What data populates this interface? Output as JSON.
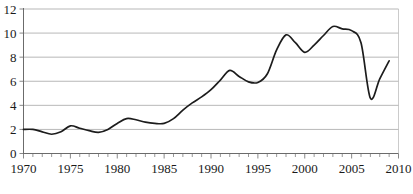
{
  "chart_data": {
    "type": "line",
    "title": "",
    "subtitle": "",
    "xlabel": "",
    "ylabel": "",
    "xlim": [
      1970,
      2010
    ],
    "ylim": [
      0,
      12
    ],
    "grid": true,
    "grid_axis": "y",
    "legend": false,
    "legend_position": "none",
    "smoothing": "spline",
    "line_color": "#1c1c1c",
    "grid_color": "#9a9a9a",
    "axis_color": "#6b6b6b",
    "x_tick_labels": [
      "1970",
      "1975",
      "1980",
      "1985",
      "1990",
      "1995",
      "2000",
      "2005",
      "2010"
    ],
    "x_tick_values": [
      1970,
      1975,
      1980,
      1985,
      1990,
      1995,
      2000,
      2005,
      2010
    ],
    "x_minor_tick_interval": 1,
    "y_tick_labels": [
      "0",
      "2",
      "4",
      "6",
      "8",
      "10",
      "12"
    ],
    "y_tick_values": [
      0,
      2,
      4,
      6,
      8,
      10,
      12
    ],
    "x": [
      1970,
      1971,
      1972,
      1973,
      1974,
      1975,
      1976,
      1977,
      1978,
      1979,
      1980,
      1981,
      1982,
      1983,
      1984,
      1985,
      1986,
      1987,
      1988,
      1989,
      1990,
      1991,
      1992,
      1993,
      1994,
      1995,
      1996,
      1997,
      1998,
      1999,
      2000,
      2001,
      2002,
      2003,
      2004,
      2005,
      2006,
      2007,
      2008,
      2009
    ],
    "values": [
      2.0,
      2.0,
      1.8,
      1.6,
      1.8,
      2.3,
      2.1,
      1.9,
      1.75,
      2.0,
      2.5,
      2.9,
      2.8,
      2.6,
      2.5,
      2.5,
      2.9,
      3.6,
      4.2,
      4.7,
      5.3,
      6.1,
      6.9,
      6.4,
      5.95,
      5.9,
      6.6,
      8.6,
      9.85,
      9.2,
      8.4,
      9.0,
      9.8,
      10.55,
      10.35,
      10.2,
      9.2,
      4.6,
      6.2,
      7.7
    ],
    "series": [
      {
        "name": "series-1",
        "values": [
          2.0,
          2.0,
          1.8,
          1.6,
          1.8,
          2.3,
          2.1,
          1.9,
          1.75,
          2.0,
          2.5,
          2.9,
          2.8,
          2.6,
          2.5,
          2.5,
          2.9,
          3.6,
          4.2,
          4.7,
          5.3,
          6.1,
          6.9,
          6.4,
          5.95,
          5.9,
          6.6,
          8.6,
          9.85,
          9.2,
          8.4,
          9.0,
          9.8,
          10.55,
          10.35,
          10.2,
          9.2,
          4.6,
          6.2,
          7.7
        ]
      }
    ],
    "annotations": []
  },
  "caption": {
    "text": "",
    "visible_fragment": ""
  }
}
